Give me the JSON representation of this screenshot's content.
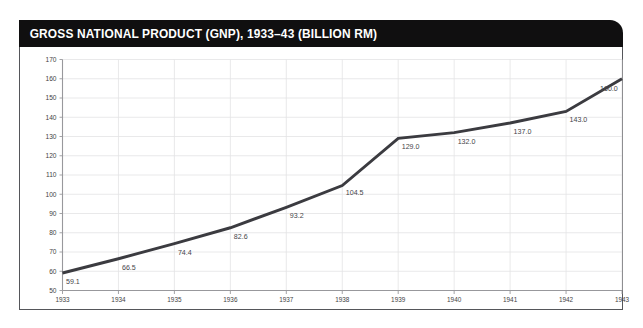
{
  "banner": {
    "title": "GROSS NATIONAL PRODUCT (GNP), 1933–43 (BILLION RM)",
    "background_color": "#100f10",
    "text_color": "#ffffff"
  },
  "colors": {
    "line": "#3b3b40",
    "gridline": "#e3e3e5",
    "axis": "#98989c",
    "frame": "#55565a",
    "label_text": "#46464a",
    "plot_background": "#ffffff"
  },
  "chart_data": {
    "type": "line",
    "title": "GROSS NATIONAL PRODUCT (GNP), 1933–43 (BILLION RM)",
    "xlabel": "",
    "ylabel": "",
    "categories": [
      "1933",
      "1934",
      "1935",
      "1936",
      "1937",
      "1938",
      "1939",
      "1940",
      "1941",
      "1942",
      "1943"
    ],
    "x": [
      1933,
      1934,
      1935,
      1936,
      1937,
      1938,
      1939,
      1940,
      1941,
      1942,
      1943
    ],
    "values": [
      59.1,
      66.5,
      74.4,
      82.6,
      93.2,
      104.5,
      129.0,
      132.0,
      137.0,
      143.0,
      160.0
    ],
    "point_labels": [
      "59.1",
      "66.5",
      "74.4",
      "82.6",
      "93.2",
      "104.5",
      "129.0",
      "132.0",
      "137.0",
      "143.0",
      "160.0"
    ],
    "ylim": [
      50,
      170
    ],
    "yticks": [
      50,
      60,
      70,
      80,
      90,
      100,
      110,
      120,
      130,
      140,
      150,
      160,
      170
    ],
    "ytick_labels": [
      "50",
      "60",
      "70",
      "80",
      "90",
      "100",
      "110",
      "120",
      "130",
      "140",
      "150",
      "160",
      "170"
    ],
    "xtick_labels": [
      "1933",
      "1934",
      "1935",
      "1936",
      "1937",
      "1938",
      "1939",
      "1940",
      "1941",
      "1942",
      "1943"
    ],
    "grid": true,
    "grid_axes": "both",
    "legend": false,
    "legend_position": "none",
    "series": [
      {
        "name": "GNP (billion RM)",
        "values": [
          59.1,
          66.5,
          74.4,
          82.6,
          93.2,
          104.5,
          129.0,
          132.0,
          137.0,
          143.0,
          160.0
        ]
      }
    ],
    "annotations": []
  }
}
